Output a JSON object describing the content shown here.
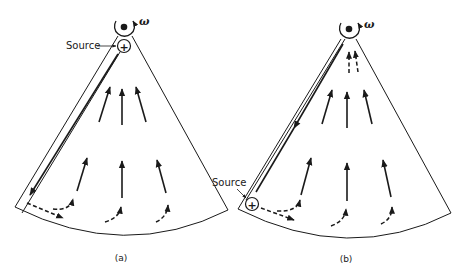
{
  "figure": {
    "panels": [
      {
        "id": "a",
        "caption": "(a)",
        "source_label": "Source",
        "source_symbol": "+",
        "rotation_symbol": "ω",
        "source_position": "near rotation axis (pivot)"
      },
      {
        "id": "b",
        "caption": "(b)",
        "source_label": "Source",
        "source_symbol": "+",
        "rotation_symbol": "ω",
        "source_position": "outer corner (rim)"
      }
    ],
    "colors": {
      "ink": "#1a1a1a",
      "background": "#ffffff"
    }
  }
}
